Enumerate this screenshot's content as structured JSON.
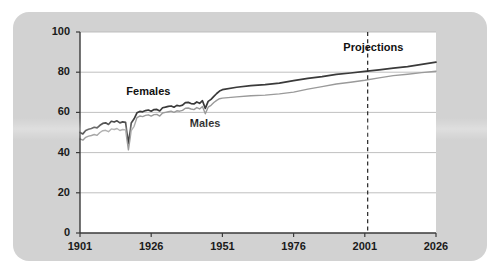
{
  "chart_data": {
    "type": "line",
    "title": "",
    "subtitle": "",
    "xlabel": "",
    "ylabel": "",
    "xlim": [
      1901,
      2026
    ],
    "ylim": [
      0,
      100
    ],
    "grid": true,
    "grid_axis": "y",
    "legend_position": "inline-annotations",
    "xticks": [
      "1901",
      "1926",
      "1951",
      "1976",
      "2001",
      "2026"
    ],
    "xtick_values": [
      1901,
      1926,
      1951,
      1976,
      2001,
      2026
    ],
    "yticks": [
      "0",
      "20",
      "40",
      "60",
      "80",
      "100"
    ],
    "ytick_values": [
      0,
      20,
      40,
      60,
      80,
      100
    ],
    "annotations": [
      {
        "text": "Females",
        "x": 1925,
        "y": 70,
        "style": "bold"
      },
      {
        "text": "Males",
        "x": 1945,
        "y": 54,
        "style": "bold"
      },
      {
        "text": "Projections",
        "x": 2004,
        "y": 92,
        "style": "bold"
      }
    ],
    "reference_lines": [
      {
        "label": "projection-start",
        "orientation": "vertical",
        "x": 2002,
        "style": "dashed",
        "color": "#333333"
      }
    ],
    "series": [
      {
        "name": "Females",
        "color": "#3a3a3a",
        "x": [
          1901,
          1902,
          1903,
          1904,
          1905,
          1906,
          1907,
          1908,
          1909,
          1910,
          1911,
          1912,
          1913,
          1914,
          1915,
          1916,
          1917,
          1918,
          1919,
          1920,
          1921,
          1922,
          1923,
          1924,
          1925,
          1926,
          1927,
          1928,
          1929,
          1930,
          1931,
          1932,
          1933,
          1934,
          1935,
          1936,
          1937,
          1938,
          1939,
          1940,
          1941,
          1942,
          1943,
          1944,
          1945,
          1946,
          1947,
          1948,
          1949,
          1950,
          1951,
          1956,
          1961,
          1966,
          1971,
          1976,
          1981,
          1986,
          1991,
          1996,
          2001,
          2006,
          2011,
          2016,
          2021,
          2026
        ],
        "values": [
          50.0,
          49.3,
          51.0,
          51.6,
          52.0,
          52.6,
          52.3,
          53.6,
          54.5,
          54.8,
          54.0,
          55.6,
          55.2,
          55.8,
          54.8,
          55.3,
          55.0,
          44.5,
          54.7,
          56.8,
          59.8,
          60.5,
          60.3,
          60.9,
          61.2,
          60.6,
          61.4,
          61.5,
          60.7,
          62.3,
          62.6,
          63.0,
          63.2,
          62.6,
          63.5,
          63.2,
          63.6,
          64.9,
          65.0,
          64.4,
          64.2,
          65.2,
          64.5,
          65.8,
          62.0,
          65.5,
          66.5,
          68.0,
          69.4,
          70.6,
          71.3,
          72.5,
          73.3,
          73.8,
          74.6,
          75.8,
          76.9,
          77.8,
          78.9,
          79.6,
          80.4,
          81.2,
          82.0,
          82.8,
          83.9,
          85.0
        ]
      },
      {
        "name": "Males",
        "color": "#9a9a9a",
        "x": [
          1901,
          1902,
          1903,
          1904,
          1905,
          1906,
          1907,
          1908,
          1909,
          1910,
          1911,
          1912,
          1913,
          1914,
          1915,
          1916,
          1917,
          1918,
          1919,
          1920,
          1921,
          1922,
          1923,
          1924,
          1925,
          1926,
          1927,
          1928,
          1929,
          1930,
          1931,
          1932,
          1933,
          1934,
          1935,
          1936,
          1937,
          1938,
          1939,
          1940,
          1941,
          1942,
          1943,
          1944,
          1945,
          1946,
          1947,
          1948,
          1949,
          1950,
          1951,
          1956,
          1961,
          1966,
          1971,
          1976,
          1981,
          1986,
          1991,
          1996,
          2001,
          2006,
          2011,
          2016,
          2021,
          2026
        ],
        "values": [
          46.8,
          46.2,
          47.6,
          48.2,
          48.5,
          49.0,
          48.6,
          50.0,
          50.9,
          51.1,
          50.4,
          51.8,
          51.5,
          52.0,
          51.0,
          51.5,
          51.3,
          41.4,
          51.0,
          53.1,
          57.4,
          58.2,
          57.9,
          58.5,
          58.8,
          58.2,
          58.9,
          59.0,
          58.2,
          59.7,
          60.0,
          60.3,
          60.6,
          60.0,
          60.8,
          60.6,
          61.0,
          62.1,
          62.2,
          61.7,
          61.4,
          62.4,
          61.7,
          62.9,
          59.3,
          62.6,
          63.5,
          64.9,
          66.0,
          66.8,
          67.1,
          67.7,
          68.3,
          68.6,
          69.2,
          70.1,
          71.6,
          72.8,
          74.1,
          75.0,
          76.0,
          77.2,
          78.3,
          79.0,
          79.8,
          80.5
        ]
      }
    ]
  }
}
